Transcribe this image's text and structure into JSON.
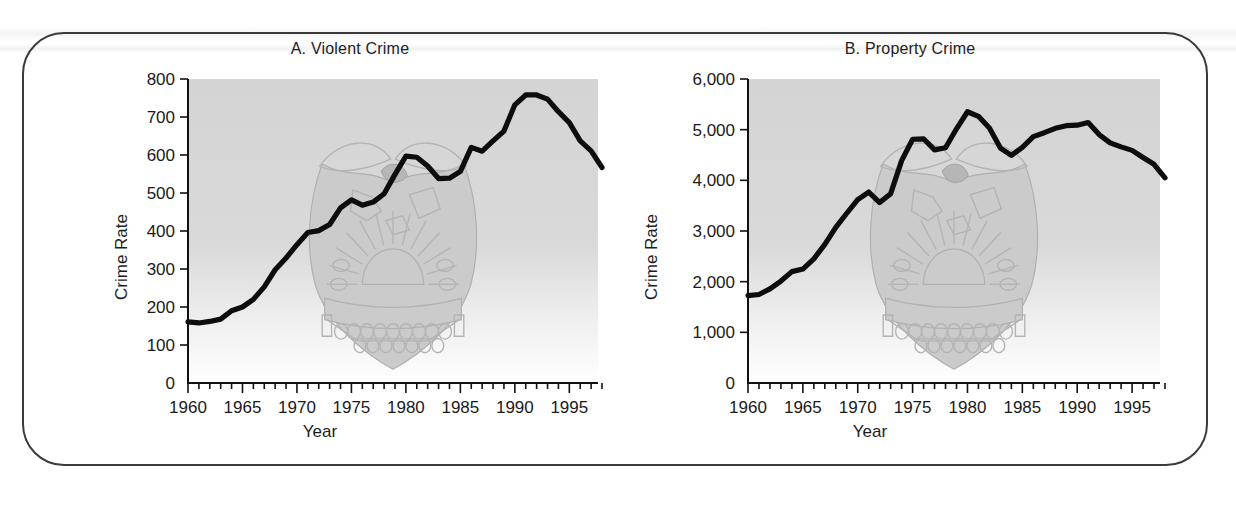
{
  "figure": {
    "background_color": "#ffffff",
    "frame_color": "#3b3b3b",
    "plot_background_color": "#d6d6d6",
    "line_color": "#0d0d0d",
    "watermark": "doj-seal-watermark"
  },
  "chart_data": [
    {
      "type": "line",
      "title": "A. Violent Crime",
      "xlabel": "Year",
      "ylabel": "Crime Rate",
      "xlim": [
        1960,
        1998
      ],
      "ylim": [
        0,
        800
      ],
      "xticks": [
        1960,
        1965,
        1970,
        1975,
        1980,
        1985,
        1990,
        1995
      ],
      "xtick_labels": [
        "1960",
        "1965",
        "1970",
        "1975",
        "1980",
        "1985",
        "1990",
        "1995"
      ],
      "yticks": [
        0,
        100,
        200,
        300,
        400,
        500,
        600,
        700,
        800
      ],
      "ytick_labels": [
        "0",
        "100",
        "200",
        "300",
        "400",
        "500",
        "600",
        "700",
        "800"
      ],
      "minor_xtick_interval": 1,
      "grid": false,
      "legend": null,
      "x": [
        1960,
        1961,
        1962,
        1963,
        1964,
        1965,
        1966,
        1967,
        1968,
        1969,
        1970,
        1971,
        1972,
        1973,
        1974,
        1975,
        1976,
        1977,
        1978,
        1979,
        1980,
        1981,
        1982,
        1983,
        1984,
        1985,
        1986,
        1987,
        1988,
        1989,
        1990,
        1991,
        1992,
        1993,
        1994,
        1995,
        1996,
        1997,
        1998
      ],
      "values": [
        161,
        158,
        162,
        168,
        190,
        200,
        220,
        253,
        298,
        329,
        364,
        396,
        401,
        417,
        461,
        482,
        468,
        476,
        498,
        549,
        597,
        594,
        571,
        538,
        539,
        557,
        620,
        610,
        637,
        663,
        732,
        758,
        758,
        747,
        714,
        685,
        637,
        611,
        567
      ]
    },
    {
      "type": "line",
      "title": "B. Property Crime",
      "xlabel": "Year",
      "ylabel": "Crime Rate",
      "xlim": [
        1960,
        1998
      ],
      "ylim": [
        0,
        6000
      ],
      "xticks": [
        1960,
        1965,
        1970,
        1975,
        1980,
        1985,
        1990,
        1995
      ],
      "xtick_labels": [
        "1960",
        "1965",
        "1970",
        "1975",
        "1980",
        "1985",
        "1990",
        "1995"
      ],
      "yticks": [
        0,
        1000,
        2000,
        3000,
        4000,
        5000,
        6000
      ],
      "ytick_labels": [
        "0",
        "1,000",
        "2,000",
        "3,000",
        "4,000",
        "5,000",
        "6,000"
      ],
      "minor_xtick_interval": 1,
      "grid": false,
      "legend": null,
      "x": [
        1960,
        1961,
        1962,
        1963,
        1964,
        1965,
        1966,
        1967,
        1968,
        1969,
        1970,
        1971,
        1972,
        1973,
        1974,
        1975,
        1976,
        1977,
        1978,
        1979,
        1980,
        1981,
        1982,
        1983,
        1984,
        1985,
        1986,
        1987,
        1988,
        1989,
        1990,
        1991,
        1992,
        1993,
        1994,
        1995,
        1996,
        1997,
        1998
      ],
      "values": [
        1726,
        1747,
        1857,
        2012,
        2198,
        2249,
        2451,
        2736,
        3071,
        3351,
        3621,
        3769,
        3561,
        3737,
        4389,
        4811,
        4820,
        4602,
        4643,
        5017,
        5353,
        5264,
        5033,
        4637,
        4492,
        4651,
        4863,
        4940,
        5027,
        5078,
        5089,
        5140,
        4903,
        4740,
        4660,
        4591,
        4451,
        4316,
        4050
      ]
    }
  ]
}
